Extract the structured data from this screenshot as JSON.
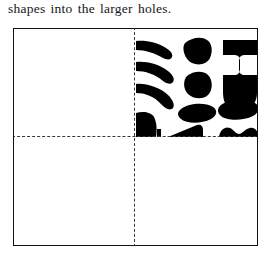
{
  "caption": {
    "text": "shapes into the larger holes."
  },
  "figure": {
    "name": "quadrant-diagram",
    "frame": {
      "border_color": "#111111",
      "background_color": "#ffffff",
      "x": 13,
      "y": 28,
      "width": 245,
      "height": 218
    },
    "dividers": {
      "style": "dashed",
      "color": "#3a3a3a",
      "vertical_x": 134,
      "horizontal_y": 136
    },
    "quadrants": [
      {
        "id": "top-left",
        "label": "top-left",
        "filled": false
      },
      {
        "id": "top-right",
        "label": "top-right",
        "filled": true
      },
      {
        "id": "bottom-left",
        "label": "bottom-left",
        "filled": false
      },
      {
        "id": "bottom-right",
        "label": "bottom-right",
        "filled": false
      }
    ],
    "shape_field": {
      "quadrant": "top-right",
      "fill_color": "#000000",
      "count": 13,
      "shapes": [
        {
          "name": "crescent-bar-1",
          "kind": "crescent"
        },
        {
          "name": "crescent-bar-2",
          "kind": "crescent"
        },
        {
          "name": "crescent-bar-3",
          "kind": "crescent"
        },
        {
          "name": "wedge-clipped",
          "kind": "wedge"
        },
        {
          "name": "blob-pentagon-1",
          "kind": "pentagon"
        },
        {
          "name": "blob-pentagon-2",
          "kind": "pentagon"
        },
        {
          "name": "blob-lozenge",
          "kind": "lozenge"
        },
        {
          "name": "triangle-clipped",
          "kind": "triangle"
        },
        {
          "name": "ibeam",
          "kind": "ibeam"
        },
        {
          "name": "bell",
          "kind": "bell"
        },
        {
          "name": "hexagon",
          "kind": "hexagon"
        },
        {
          "name": "double-hump-clipped",
          "kind": "double-hump"
        },
        {
          "name": "edge-sliver",
          "kind": "sliver"
        }
      ]
    }
  }
}
